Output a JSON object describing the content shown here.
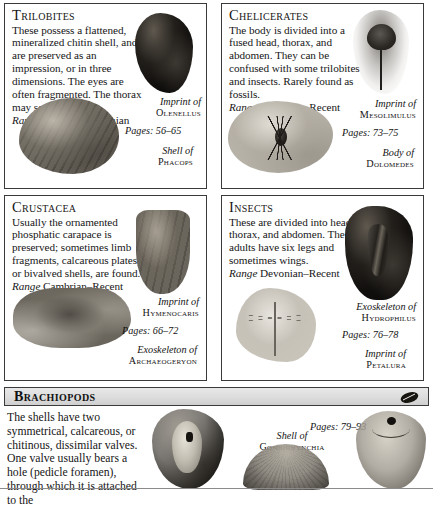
{
  "panels": [
    {
      "id": "trilobites",
      "heading": "Trilobites",
      "body": "These possess a flattened, mineralized chitin shell, and are preserved as an impression, or in three dimensions. The eyes are often fragmented. The thorax may segment.",
      "range_label": "Range",
      "range_value": "Cambrian–Permian",
      "pages": "Pages: 56–65",
      "specimens": [
        {
          "caption_of": "Imprint of",
          "genus": "Olenellus",
          "icon": "fossil-imprint-specimen"
        },
        {
          "caption_of": "Shell of",
          "genus": "Phacops",
          "icon": "fossil-shell-specimen"
        }
      ]
    },
    {
      "id": "chelicerates",
      "heading": "Chelicerates",
      "body": "The body is divided into a fused head, thorax, and abdomen. They can be confused with some trilobites and insects. Rarely found as fossils.",
      "range_label": "Range",
      "range_value": "Cambrian–Recent",
      "pages": "Pages: 73–75",
      "specimens": [
        {
          "caption_of": "Imprint of",
          "genus": "Mesolimulus",
          "icon": "horseshoe-crab-imprint-specimen"
        },
        {
          "caption_of": "Body of",
          "genus": "Dolomedes",
          "icon": "spider-body-specimen"
        }
      ]
    },
    {
      "id": "crustacea",
      "heading": "Crustacea",
      "body": "Usually the ornamented phosphatic carapace is preserved; sometimes limb fragments, calcareous plates, or bivalved shells, are found.",
      "range_label": "Range",
      "range_value": "Cambrian–Recent",
      "pages": "Pages: 66–72",
      "specimens": [
        {
          "caption_of": "Imprint of",
          "genus": "Hymenocaris",
          "icon": "carapace-imprint-specimen"
        },
        {
          "caption_of": "Exoskeleton of",
          "genus": "Archaeogeryon",
          "icon": "crab-exoskeleton-specimen"
        }
      ]
    },
    {
      "id": "insects",
      "heading": "Insects",
      "body": "These are divided into head, thorax, and abdomen. The adults have six legs and sometimes wings.",
      "range_label": "Range",
      "range_value": "Devonian–Recent",
      "pages": "Pages: 76–78",
      "specimens": [
        {
          "caption_of": "Exoskeleton of",
          "genus": "Hydrophilus",
          "icon": "beetle-exoskeleton-specimen"
        },
        {
          "caption_of": "Imprint of",
          "genus": "Petalura",
          "icon": "dragonfly-imprint-specimen"
        }
      ]
    }
  ],
  "brachiopods": {
    "heading": "Brachiopods",
    "icon": "brachiopod-shell-icon",
    "body": "The shells have two symmetrical, calcareous, or chitinous, dissimilar valves. One valve usually bears a hole (pedicle foramen), through which it is attached to the",
    "pages": "Pages: 79–93",
    "specimens": [
      {
        "caption_of": "Shell of",
        "genus": "Goniorhynchia",
        "icon": "brachiopod-in-matrix-specimen"
      },
      {
        "icon": "brachiopod-ribbed-specimen"
      },
      {
        "icon": "brachiopod-pedicle-foramen-specimen"
      }
    ]
  }
}
